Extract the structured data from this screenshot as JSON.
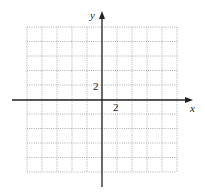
{
  "diagram": {
    "type": "coordinate-grid",
    "x_axis_label": "x",
    "y_axis_label": "y",
    "x_tick_label": "2",
    "y_tick_label": "2",
    "grid_cells_x": 10,
    "grid_cells_y": 10,
    "x_range": [
      -10,
      10
    ],
    "y_range": [
      -10,
      10
    ],
    "tick_step": 2,
    "grid_line_style": "dotted",
    "colors": {
      "grid": "#9a9a9a",
      "axis": "#222222",
      "background": "#ffffff"
    }
  }
}
